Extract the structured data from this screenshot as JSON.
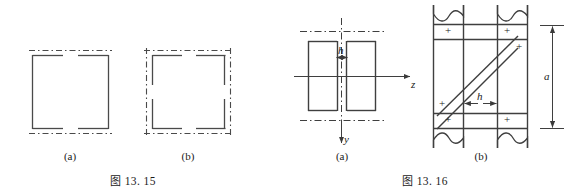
{
  "document": {
    "background_color": "#ffffff",
    "ink_color": "#3a3a3a",
    "text_color": "#1a1a1a"
  },
  "figures": [
    {
      "id": "fig-13-15",
      "caption_prefix": "图",
      "caption_number": "13. 15",
      "caption_full": "图 13. 15",
      "subfigures": [
        {
          "key": "a",
          "label": "(a)",
          "description": "square section with solid side walls and dash-dot centre lines top and bottom"
        },
        {
          "key": "b",
          "label": "(b)",
          "description": "square section with dash-dot centre lines on all four sides and corner brackets"
        }
      ]
    },
    {
      "id": "fig-13-16",
      "caption_prefix": "图",
      "caption_number": "13. 16",
      "caption_full": "图 13. 16",
      "subfigures": [
        {
          "key": "a",
          "label": "(a)",
          "description": "I-beam cross section with centroidal axes",
          "dimensions": [
            {
              "name": "h",
              "label": "h",
              "orientation": "horizontal",
              "target": "web-thickness"
            }
          ],
          "axes": [
            {
              "name": "z",
              "label": "z",
              "direction": "right"
            },
            {
              "name": "y",
              "label": "y",
              "direction": "down"
            }
          ]
        },
        {
          "key": "b",
          "label": "(b)",
          "description": "riveted lattice panel with diagonal brace, break lines top and bottom",
          "dimensions": [
            {
              "name": "a",
              "label": "a",
              "orientation": "vertical",
              "target": "panel-height"
            },
            {
              "name": "h",
              "label": "h",
              "orientation": "horizontal",
              "target": "brace-width"
            }
          ],
          "rivets": [
            {
              "id": "rivet-top-left",
              "glyph": "+"
            },
            {
              "id": "rivet-top-right",
              "glyph": "+"
            },
            {
              "id": "rivet-mid-right",
              "glyph": "+"
            },
            {
              "id": "rivet-mid-left",
              "glyph": "+"
            },
            {
              "id": "rivet-bottom-left",
              "glyph": "+"
            },
            {
              "id": "rivet-bottom-right",
              "glyph": "+"
            }
          ]
        }
      ]
    }
  ]
}
